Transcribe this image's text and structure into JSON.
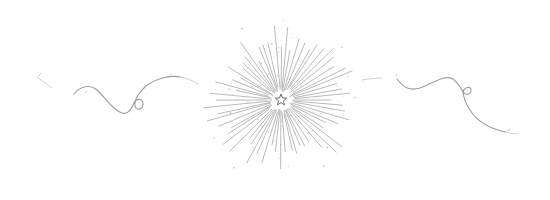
{
  "illustration": {
    "description": "Hand-drawn pencil sketch divider: central starburst with small star, flanked by curly vines",
    "colors": {
      "background": "#ffffff",
      "stroke": "#8c8c8c",
      "ray": "#9a9a9a",
      "star": "#6e6e6e"
    },
    "starburst": {
      "center_x": 281,
      "center_y": 100,
      "ray_count": 64,
      "inner_radius": 9,
      "outer_radius_min": 45,
      "outer_radius_max": 78,
      "speck_count": 70
    },
    "star": {
      "center_x": 281,
      "center_y": 100,
      "outer_radius": 6,
      "inner_radius": 2.6,
      "points": 5
    }
  }
}
